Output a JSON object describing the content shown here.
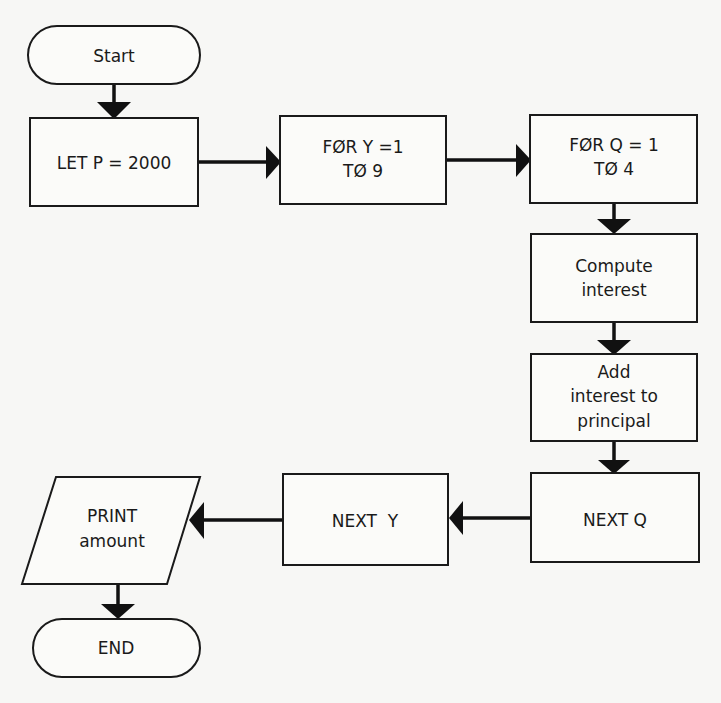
{
  "diagram": {
    "type": "flowchart",
    "nodes": {
      "start": {
        "shape": "terminator",
        "lines": [
          "Start"
        ]
      },
      "let_p": {
        "shape": "process",
        "lines": [
          "LET P = 2000"
        ]
      },
      "for_y": {
        "shape": "process",
        "lines": [
          "FØR Y =1",
          "TØ 9"
        ]
      },
      "for_q": {
        "shape": "process",
        "lines": [
          "FØR Q = 1",
          "TØ 4"
        ]
      },
      "compute": {
        "shape": "process",
        "lines": [
          "Compute",
          "interest"
        ]
      },
      "add_interest": {
        "shape": "process",
        "lines": [
          "Add",
          "interest to",
          "principal"
        ]
      },
      "next_q": {
        "shape": "process",
        "lines": [
          "NEXT Q"
        ]
      },
      "next_y": {
        "shape": "process",
        "lines": [
          "NEXT  Y"
        ]
      },
      "print": {
        "shape": "io",
        "lines": [
          "PRINT",
          "amount"
        ]
      },
      "end": {
        "shape": "terminator",
        "lines": [
          "END"
        ]
      }
    },
    "edges": [
      {
        "from": "start",
        "to": "let_p"
      },
      {
        "from": "let_p",
        "to": "for_y"
      },
      {
        "from": "for_y",
        "to": "for_q"
      },
      {
        "from": "for_q",
        "to": "compute"
      },
      {
        "from": "compute",
        "to": "add_interest"
      },
      {
        "from": "add_interest",
        "to": "next_q"
      },
      {
        "from": "next_q",
        "to": "next_y"
      },
      {
        "from": "next_y",
        "to": "print"
      },
      {
        "from": "print",
        "to": "end"
      }
    ]
  }
}
